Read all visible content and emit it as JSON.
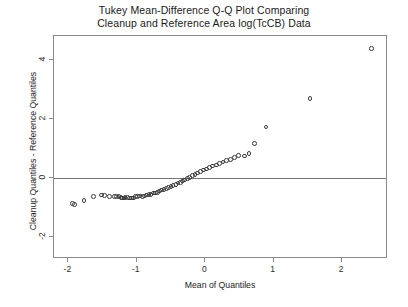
{
  "chart_data": {
    "type": "scatter",
    "title": "Tukey Mean-Difference Q-Q Plot Comparing Cleanup and Reference Area log(TcCB) Data",
    "title_lines": [
      "Tukey Mean-Difference Q-Q Plot Comparing",
      "Cleanup and Reference Area log(TcCB) Data"
    ],
    "xlabel": "Mean of Quantiles",
    "ylabel": "Cleanup Quantiles - Reference Quantiles",
    "xlim": [
      -2.21,
      2.67
    ],
    "ylim": [
      -2.75,
      4.83
    ],
    "xticks": [
      -2,
      -1,
      0,
      1,
      2
    ],
    "xtick_labels": [
      "-2",
      "-1",
      "0",
      "1",
      "2"
    ],
    "yticks": [
      -2,
      0,
      2,
      4
    ],
    "ytick_labels": [
      "-2",
      "0",
      "2",
      "4"
    ],
    "grid": false,
    "legend": null,
    "reference_line": {
      "type": "horizontal",
      "y": 0,
      "color": "#757575"
    },
    "marker": {
      "shape": "circle",
      "filled": false,
      "color": "#3b3b3b",
      "size": 4.6
    },
    "series": [
      {
        "name": "Cleanup vs Reference log(TcCB) quantile pairs",
        "x": [
          -1.94,
          -1.91,
          -1.77,
          -1.63,
          -1.52,
          -1.47,
          -1.4,
          -1.33,
          -1.3,
          -1.26,
          -1.23,
          -1.21,
          -1.19,
          -1.17,
          -1.14,
          -1.11,
          -1.08,
          -1.05,
          -1.02,
          -0.99,
          -0.96,
          -0.92,
          -0.89,
          -0.86,
          -0.82,
          -0.79,
          -0.76,
          -0.73,
          -0.7,
          -0.67,
          -0.64,
          -0.6,
          -0.57,
          -0.54,
          -0.5,
          -0.47,
          -0.43,
          -0.4,
          -0.36,
          -0.33,
          -0.3,
          -0.26,
          -0.23,
          -0.19,
          -0.15,
          -0.11,
          -0.07,
          -0.03,
          0.02,
          0.06,
          0.11,
          0.16,
          0.21,
          0.26,
          0.31,
          0.37,
          0.43,
          0.49,
          0.57,
          0.64,
          0.72,
          0.89,
          1.53,
          2.43
        ],
        "y": [
          -0.86,
          -0.9,
          -0.76,
          -0.62,
          -0.58,
          -0.59,
          -0.62,
          -0.63,
          -0.63,
          -0.63,
          -0.66,
          -0.67,
          -0.67,
          -0.66,
          -0.65,
          -0.68,
          -0.68,
          -0.67,
          -0.63,
          -0.62,
          -0.61,
          -0.62,
          -0.61,
          -0.58,
          -0.55,
          -0.55,
          -0.51,
          -0.5,
          -0.48,
          -0.44,
          -0.41,
          -0.38,
          -0.35,
          -0.31,
          -0.28,
          -0.25,
          -0.22,
          -0.17,
          -0.14,
          -0.1,
          -0.07,
          -0.02,
          0.03,
          0.08,
          0.12,
          0.17,
          0.22,
          0.27,
          0.31,
          0.36,
          0.41,
          0.45,
          0.5,
          0.55,
          0.6,
          0.64,
          0.7,
          0.77,
          0.75,
          0.83,
          1.17,
          1.74,
          2.7,
          4.4
        ]
      }
    ]
  }
}
